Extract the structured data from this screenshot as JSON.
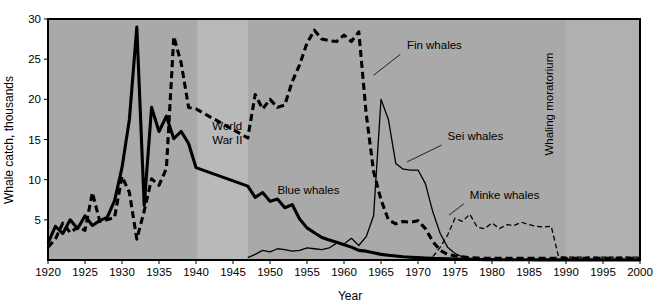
{
  "chart_data": {
    "type": "line",
    "title": "",
    "xlabel": "Year",
    "ylabel": "Whale catch, thousands",
    "xlim": [
      1920,
      2000
    ],
    "ylim": [
      0,
      30
    ],
    "grid": false,
    "legend_position": "inline-annotations",
    "xticks": [
      1920,
      1925,
      1930,
      1935,
      1940,
      1945,
      1950,
      1955,
      1960,
      1965,
      1970,
      1975,
      1980,
      1985,
      1990,
      1995,
      2000
    ],
    "yticks": [
      5,
      10,
      15,
      20,
      25,
      30
    ],
    "xtick_labels": [
      "1920",
      "1925",
      "1930",
      "1935",
      "1940",
      "1945",
      "1950",
      "1955",
      "1960",
      "1965",
      "1970",
      "1975",
      "1980",
      "1985",
      "1990",
      "1995",
      "2000"
    ],
    "ytick_labels": [
      "5",
      "10",
      "15",
      "20",
      "25",
      "30"
    ],
    "annotations": [
      {
        "name": "world-war-2",
        "text": "World War II",
        "lines": [
          "World",
          "War II"
        ],
        "x": 1942.2,
        "y": 16.2,
        "rotation": 0
      },
      {
        "name": "whaling-moratorium",
        "text": "Whaling moratorium",
        "x": 1988.3,
        "y": 13.0,
        "rotation": -90
      }
    ],
    "shaded_regions": [
      {
        "name": "world-war-2-band",
        "x0": 1940.2,
        "x1": 1947.0,
        "color": "#b9b9b9"
      },
      {
        "name": "whaling-moratorium-band",
        "x0": 1990.0,
        "x1": 2000.0,
        "color": "#b0b0b0"
      }
    ],
    "plot_background": "#a9a9a9",
    "series": [
      {
        "name": "Blue whales",
        "style": "solid",
        "width": 3.1,
        "color": "#000000",
        "label_x": 1951.0,
        "label_y": 8.2,
        "leader": null,
        "x": [
          1920,
          1921,
          1922,
          1923,
          1924,
          1925,
          1926,
          1927,
          1928,
          1929,
          1930,
          1931,
          1932,
          1933,
          1934,
          1935,
          1936,
          1937,
          1938,
          1939,
          1940,
          1947,
          1948,
          1949,
          1950,
          1951,
          1952,
          1953,
          1954,
          1955,
          1956,
          1957,
          1958,
          1959,
          1960,
          1961,
          1962,
          1963,
          1964,
          1965,
          1966,
          1967,
          1968,
          1969,
          1970,
          1971,
          1972,
          1973,
          1974,
          1975,
          1976,
          1977,
          1978,
          1979,
          1980,
          1981,
          1982,
          1983,
          1984,
          1985,
          1986,
          1987,
          1988,
          1989,
          1990,
          1995,
          2000
        ],
        "values": [
          2.1,
          4.2,
          3.3,
          5.0,
          3.9,
          5.5,
          4.3,
          4.9,
          5.3,
          7.4,
          11.5,
          17.5,
          29.0,
          6.8,
          19.0,
          16.0,
          17.9,
          15.1,
          16.0,
          14.5,
          11.5,
          9.2,
          7.8,
          8.4,
          7.3,
          7.6,
          6.5,
          6.9,
          5.1,
          4.0,
          3.4,
          2.8,
          2.5,
          2.2,
          1.9,
          1.6,
          1.2,
          1.1,
          0.9,
          0.7,
          0.6,
          0.5,
          0.4,
          0.35,
          0.3,
          0.25,
          0.2,
          0.18,
          0.15,
          0.12,
          0.1,
          0.08,
          0.06,
          0.05,
          0.05,
          0.04,
          0.04,
          0.03,
          0.03,
          0.03,
          0.02,
          0.02,
          0.02,
          0.02,
          0.02,
          0.02,
          0.02
        ]
      },
      {
        "name": "Fin whales",
        "style": "dashed",
        "width": 3.1,
        "dasharray": "7,4",
        "color": "#000000",
        "label_x": 1968.5,
        "label_y": 26.3,
        "leader": {
          "x1": 1967.6,
          "y1": 25.6,
          "x2": 1964.0,
          "y2": 23.0
        },
        "x": [
          1920,
          1921,
          1922,
          1923,
          1924,
          1925,
          1926,
          1927,
          1928,
          1929,
          1930,
          1931,
          1932,
          1933,
          1934,
          1935,
          1936,
          1937,
          1938,
          1939,
          1940,
          1947,
          1948,
          1949,
          1950,
          1951,
          1952,
          1953,
          1954,
          1955,
          1956,
          1957,
          1958,
          1959,
          1960,
          1961,
          1962,
          1963,
          1964,
          1965,
          1966,
          1967,
          1968,
          1969,
          1970,
          1971,
          1972,
          1973,
          1974,
          1975,
          1976,
          1977,
          1978,
          1979,
          1980,
          1981,
          1982,
          1983,
          1984,
          1985,
          1986,
          1987,
          1988,
          1989,
          1990,
          1995,
          2000
        ],
        "values": [
          1.6,
          2.6,
          4.6,
          3.4,
          4.1,
          3.7,
          8.4,
          4.8,
          5.0,
          5.3,
          10.4,
          8.4,
          2.6,
          6.1,
          10.1,
          9.3,
          11.4,
          27.8,
          24.5,
          19.0,
          18.8,
          15.2,
          20.6,
          18.8,
          20.0,
          19.0,
          19.3,
          22.2,
          24.3,
          27.0,
          28.6,
          27.5,
          27.3,
          27.2,
          28.0,
          27.2,
          28.4,
          18.2,
          11.0,
          7.5,
          5.0,
          4.5,
          4.8,
          4.7,
          4.9,
          3.9,
          2.3,
          1.2,
          0.7,
          0.5,
          0.4,
          0.3,
          0.25,
          0.2,
          0.2,
          0.2,
          0.2,
          0.2,
          0.2,
          0.2,
          0.2,
          0.2,
          0.2,
          0.2,
          0.2,
          0.2,
          0.2
        ]
      },
      {
        "name": "Sei whales",
        "style": "solid",
        "width": 1.3,
        "color": "#000000",
        "label_x": 1974.0,
        "label_y": 14.9,
        "leader": {
          "x1": 1973.2,
          "y1": 14.3,
          "x2": 1968.5,
          "y2": 12.2
        },
        "x": [
          1947,
          1948,
          1949,
          1950,
          1951,
          1952,
          1953,
          1954,
          1955,
          1956,
          1957,
          1958,
          1959,
          1960,
          1961,
          1962,
          1963,
          1964,
          1965,
          1966,
          1967,
          1968,
          1969,
          1970,
          1971,
          1972,
          1973,
          1974,
          1975,
          1976,
          1977,
          1978,
          1979,
          1980,
          1985,
          1990,
          1995,
          2000
        ],
        "values": [
          0.3,
          0.7,
          1.2,
          1.0,
          1.4,
          1.3,
          1.1,
          1.2,
          1.5,
          1.4,
          1.3,
          1.5,
          2.1,
          2.0,
          2.7,
          1.8,
          2.9,
          5.5,
          20.0,
          17.5,
          12.0,
          11.3,
          11.2,
          11.2,
          9.5,
          6.0,
          3.3,
          1.6,
          0.8,
          0.4,
          0.2,
          0.1,
          0.05,
          0.03,
          0.02,
          0.02,
          0.02,
          0.02
        ]
      },
      {
        "name": "Minke whales",
        "style": "dashed",
        "width": 1.3,
        "dasharray": "5,3",
        "color": "#000000",
        "label_x": 1977.0,
        "label_y": 7.6,
        "leader": {
          "x1": 1976.2,
          "y1": 7.0,
          "x2": 1974.2,
          "y2": 5.6
        },
        "x": [
          1971,
          1972,
          1973,
          1974,
          1975,
          1976,
          1977,
          1978,
          1979,
          1980,
          1981,
          1982,
          1983,
          1984,
          1985,
          1986,
          1987,
          1988,
          1989,
          1990,
          1991,
          1995,
          2000
        ],
        "values": [
          0.05,
          0.4,
          1.6,
          3.1,
          5.2,
          4.8,
          5.7,
          4.1,
          3.9,
          4.6,
          3.9,
          4.4,
          4.3,
          4.7,
          4.4,
          4.2,
          4.1,
          4.2,
          0.4,
          0.35,
          0.35,
          0.35,
          0.35
        ]
      }
    ]
  },
  "figure": {
    "caption": "",
    "frame_color": "#000000",
    "page_background": "#ffffff"
  }
}
